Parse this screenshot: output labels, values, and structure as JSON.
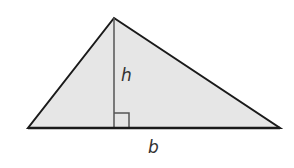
{
  "diagram": {
    "fill_color": "#e6e6e6",
    "stroke_color": "#1a1a1a",
    "height_line_color": "#555555",
    "vertices": {
      "apex": [
        114,
        18
      ],
      "left": [
        28,
        128
      ],
      "right": [
        280,
        128
      ]
    },
    "height_foot": [
      114,
      128
    ],
    "right_angle_marker_size": 15,
    "labels": {
      "height": "h",
      "base": "b"
    }
  }
}
